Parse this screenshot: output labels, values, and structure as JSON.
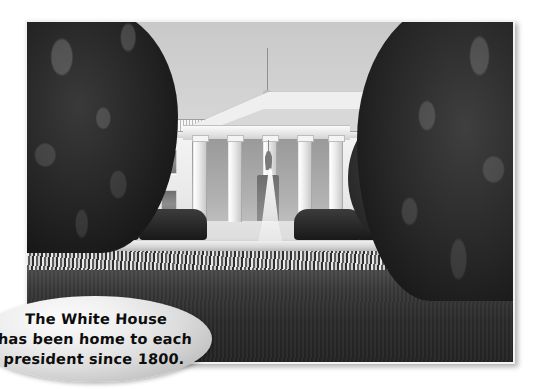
{
  "page": {
    "background_color": "#ffffff",
    "width": 542,
    "height": 391
  },
  "photo": {
    "subject": "The White House north facade",
    "style": "black-and-white photograph",
    "border_color": "#f2f2f2",
    "alt_text": "Black and white photograph of the White House with its columned North Portico, a fountain on the front lawn, hedges, a flower bed and large trees on both sides.",
    "elements": [
      {
        "name": "sky",
        "label": "Sky"
      },
      {
        "name": "flagpole",
        "label": "Flagpole on roof"
      },
      {
        "name": "pediment",
        "label": "Portico pediment"
      },
      {
        "name": "columns",
        "label": "Portico columns",
        "count": 5
      },
      {
        "name": "entrance",
        "label": "Main entrance doorway"
      },
      {
        "name": "lantern",
        "label": "Hanging lantern"
      },
      {
        "name": "windows",
        "label": "Facade windows"
      },
      {
        "name": "hedges",
        "label": "Hedges"
      },
      {
        "name": "fountain",
        "label": "North lawn fountain"
      },
      {
        "name": "flowerbed",
        "label": "Flower bed"
      },
      {
        "name": "lawn",
        "label": "Front lawn"
      },
      {
        "name": "tree-left",
        "label": "Tree at left"
      },
      {
        "name": "tree-right",
        "label": "Tree at right"
      }
    ]
  },
  "caption": {
    "text": "The White House\nhas been home to each\npresident since 1800.",
    "lines": [
      "The White House",
      "has been home to each",
      "president since 1800."
    ],
    "shape": "oval",
    "fill_color": "#e3e3e3",
    "text_color": "#0d0d0d"
  }
}
